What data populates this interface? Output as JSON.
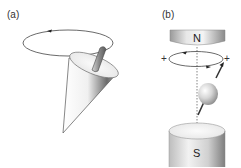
{
  "panels": [
    {
      "id": "a",
      "label": "(a)",
      "description": "Spinning cone (precessing spin axis) with circular precession path"
    },
    {
      "id": "b",
      "label": "(b)",
      "description": "Spinning particle precessing between magnet poles",
      "magnet_top_label": "N",
      "magnet_bottom_label": "S",
      "orbit_left_sign": "+",
      "orbit_right_sign": "+"
    }
  ],
  "colors": {
    "line": "#333333",
    "shade_dark": "#6e6e6e",
    "shade_light": "#f4f4f4",
    "background": "#ffffff"
  }
}
